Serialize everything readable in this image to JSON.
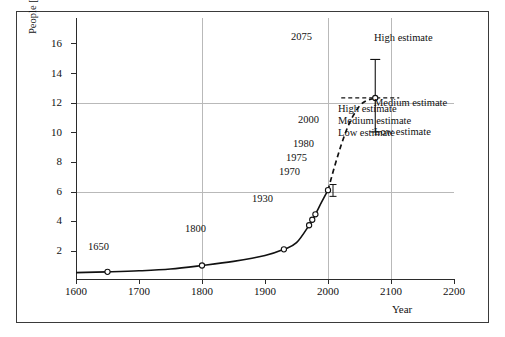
{
  "chart_data": {
    "type": "line",
    "title": "",
    "xlabel": "Year",
    "ylabel": "People [10⁹]",
    "ylabel_base": "People [10",
    "ylabel_exp": "9",
    "ylabel_close": "]",
    "xlim": [
      1600,
      2200
    ],
    "ylim": [
      0,
      17.7
    ],
    "xticks": [
      1600,
      1700,
      1800,
      1900,
      2000,
      2100,
      2200
    ],
    "yticks": [
      2,
      4,
      6,
      8,
      10,
      12,
      14,
      16
    ],
    "grid_y": [
      6,
      12
    ],
    "grid_x": [
      1800,
      2000,
      2100
    ],
    "grid": "partial",
    "legend": "none",
    "series": [
      {
        "name": "Historical population",
        "style": "solid",
        "x": [
          1600,
          1650,
          1700,
          1750,
          1800,
          1850,
          1900,
          1930,
          1950,
          1970,
          1975,
          1980,
          1990,
          2000
        ],
        "y": [
          0.5,
          0.55,
          0.62,
          0.74,
          0.98,
          1.26,
          1.65,
          2.07,
          2.52,
          3.7,
          4.07,
          4.44,
          5.27,
          6.07
        ]
      },
      {
        "name": "Projection (medium estimate)",
        "style": "dashed",
        "x": [
          2000,
          2010,
          2020,
          2030,
          2040,
          2050,
          2060,
          2075
        ],
        "y": [
          6.07,
          7.6,
          9.0,
          10.2,
          11.1,
          11.75,
          12.1,
          12.3
        ]
      }
    ],
    "markers": [
      {
        "label": "1650",
        "x": 1650,
        "y": 0.55
      },
      {
        "label": "1800",
        "x": 1800,
        "y": 0.98
      },
      {
        "label": "1930",
        "x": 1930,
        "y": 2.07
      },
      {
        "label": "1970",
        "x": 1970,
        "y": 3.7
      },
      {
        "label": "1975",
        "x": 1975,
        "y": 4.07
      },
      {
        "label": "1980",
        "x": 1980,
        "y": 4.44
      },
      {
        "label": "2000",
        "x": 2000,
        "y": 6.07
      },
      {
        "label": "2075",
        "x": 2075,
        "y": 12.3
      }
    ],
    "annotations": [
      {
        "name": "estimate-bracket-2000",
        "x": 2000,
        "high": 6.45,
        "medium": 6.07,
        "low": 5.65,
        "labels": [
          "High estimate",
          "Medium estimate",
          "Low estimate"
        ]
      },
      {
        "name": "estimate-errorbar-2075",
        "x": 2075,
        "high": 14.9,
        "medium": 12.3,
        "low": 10.0,
        "labels": [
          "High estimate",
          "Medium estimate",
          "Low estimate"
        ]
      }
    ]
  },
  "axes": {
    "ylabel_text": "People [10",
    "ylabel_sup": "9",
    "ylabel_tail": "]",
    "xlabel_text": "Year",
    "ytick_labels": [
      "16",
      "14",
      "12",
      "10",
      "8",
      "6",
      "4",
      "2"
    ],
    "xtick_labels": [
      "1600",
      "1700",
      "1800",
      "1900",
      "2000",
      "2100",
      "2200"
    ]
  },
  "point_labels": {
    "y1650": "1650",
    "y1800": "1800",
    "y1930": "1930",
    "y1970": "1970",
    "y1975": "1975",
    "y1980": "1980",
    "y2000": "2000",
    "y2075": "2075"
  },
  "estimates_2000": {
    "high": "High estimate",
    "medium": "Medium estimate",
    "low": "Low estimate"
  },
  "estimates_2075": {
    "high": "High estimate",
    "medium": "Medium estimate",
    "low": "Low estimate"
  },
  "colors": {
    "frame": "#3a3a3a",
    "axis": "#2b2b2b",
    "grid": "#b9b9b9",
    "curve": "#111111",
    "text": "#111111",
    "background": "#ffffff"
  }
}
